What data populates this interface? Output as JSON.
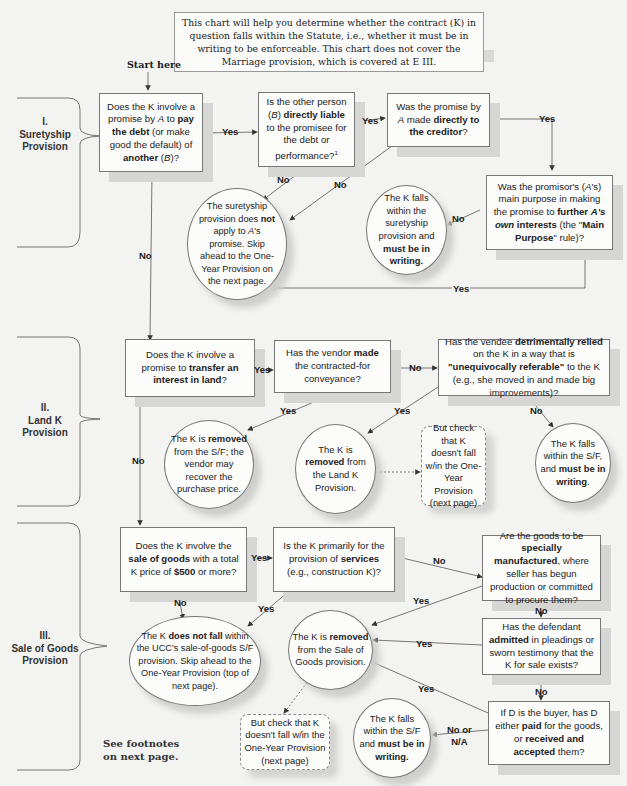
{
  "intro": "This chart will help you determine whether the contract (K) in question falls within the Statute, i.e., whether it must be in writing to be enforceable. This chart does not cover the Marriage provision, which is covered at E III.",
  "start_label": "Start here",
  "sections": [
    {
      "num": "I.",
      "name1": "Suretyship",
      "name2": "Provision"
    },
    {
      "num": "II.",
      "name1": "Land K",
      "name2": "Provision"
    },
    {
      "num": "III.",
      "name1": "Sale of Goods",
      "name2": "Provision"
    }
  ],
  "footnote": {
    "line1": "See footnotes",
    "line2": "on next page."
  },
  "edge_labels": {
    "yes": "Yes",
    "no": "No",
    "no_or_na_1": "No or",
    "no_or_na_2": "N/A"
  },
  "nodes": {
    "s1_q1": {
      "t1": "Does the K involve a promise by ",
      "i1": "A",
      "t2": " to ",
      "b1": "pay the debt",
      "t3": " (or make good the default) of ",
      "b2": "another",
      "t4": " (",
      "i2": "B",
      "t5": ")?"
    },
    "s1_q2": {
      "t1": "Is the other person (",
      "i1": "B",
      "t2": ") ",
      "b1": "directly liable",
      "t3": " to the promisee for the debt or performance?",
      "sup": "1"
    },
    "s1_q3": {
      "t1": "Was the promise by ",
      "i1": "A",
      "t2": " made ",
      "b1": "directly to the creditor",
      "t3": "?"
    },
    "s1_q4": {
      "t1": "Was the promisor's (",
      "i1": "A",
      "t2": "'s) main purpose in making the promise to ",
      "b1": "further ",
      "bi1": "A's own",
      "b2": " interests",
      "t3": " (the \"",
      "b3": "Main Purpose",
      "t4": "\" rule)?"
    },
    "s1_out_no": {
      "t1": "The suretyship provision does ",
      "b1": "not",
      "t2": " apply to ",
      "i1": "A",
      "t3": "'s promise. Skip ahead to the One-Year Provision on the next page."
    },
    "s1_out_yes": {
      "t1": "The K falls within the suretyship provision and ",
      "b1": "must be in writing."
    },
    "s2_q1": {
      "t1": "Does the K involve a promise to ",
      "b1": "transfer an interest in land",
      "t2": "?"
    },
    "s2_q2": {
      "t1": "Has the vendor ",
      "b1": "made",
      "t2": " the contracted-for conveyance?"
    },
    "s2_q3": {
      "t1": "Has the vendee ",
      "b1": "detrimentally relied",
      "t2": " on the K in a way that is ",
      "b2": "\"unequivocally referable\"",
      "t3": " to the K (e.g., she moved in and made big improvements)?"
    },
    "s2_out_removed_sf": {
      "t1": "The K is ",
      "b1": "removed",
      "t2": " from the S/F; the vendor may recover the purchase price."
    },
    "s2_out_removed_land": {
      "t1": "The K is ",
      "b1": "removed",
      "t2": " from the Land K Provision."
    },
    "s2_check": "But check that K doesn't fall w/in the One-Year Provision (next page)",
    "s2_out_writing": {
      "t1": "The K falls within the S/F, and ",
      "b1": "must be in writing",
      "t2": "."
    },
    "s3_q1": {
      "t1": "Does the K involve the ",
      "b1": "sale of goods",
      "t2": " with a total K price of ",
      "b2": "$500",
      "t3": " or more?"
    },
    "s3_q2": {
      "t1": "Is the K primarily for the provision of ",
      "b1": "services",
      "t2": " (e.g., construction K)?"
    },
    "s3_q3": {
      "t1": "Are the goods to be ",
      "b1": "specially manufactured",
      "t2": ", where seller has begun production or committed to procure them?"
    },
    "s3_q4": {
      "t1": "Has the defendant ",
      "b1": "admitted",
      "t2": " in pleadings or sworn testimony that the K for sale exists?"
    },
    "s3_q5": {
      "t1": "If D is the buyer, has D either ",
      "b1": "paid",
      "t2": " for the goods, or ",
      "b2": "received and accepted",
      "t3": " them?"
    },
    "s3_out_notfall": {
      "t1": "The K ",
      "b1": "does not fall",
      "t2": " within the UCC's sale-of-goods S/F provision. Skip ahead to the One-Year Provision (top of next page)."
    },
    "s3_out_removed": {
      "t1": "The K is ",
      "b1": "removed",
      "t2": " from the Sale of Goods provision."
    },
    "s3_check": "But check that K doesn't fall w/in the One-Year Provision (next page)",
    "s3_out_writing": {
      "t1": "The K falls within the S/F and ",
      "b1": "must be in writing."
    }
  },
  "colors": {
    "background": "#f3f3f1",
    "line": "#555555",
    "shadow": "#d6d6d4",
    "box_fill": "#fcfcfb"
  }
}
